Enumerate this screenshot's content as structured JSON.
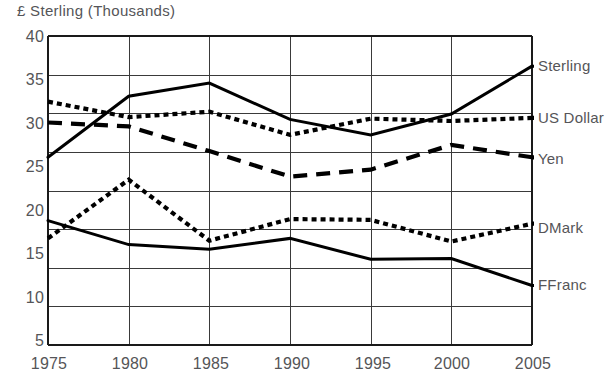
{
  "chart_data": {
    "type": "line",
    "title": "",
    "ylabel": "£ Sterling (Thousands)",
    "xlabel": "",
    "categories": [
      1975,
      1980,
      1985,
      1990,
      1995,
      2000,
      2005
    ],
    "x": [
      1975,
      1980,
      1985,
      1990,
      1995,
      2000,
      2005
    ],
    "xtick_labels": [
      "1975",
      "1980",
      "1985",
      "1990",
      "1995",
      "2000",
      "2005"
    ],
    "ytick_labels": [
      "5",
      "10",
      "15",
      "20",
      "25",
      "30",
      "35",
      "40"
    ],
    "yticks": [
      5,
      10,
      15,
      20,
      25,
      30,
      35,
      40
    ],
    "ylim": [
      0,
      40
    ],
    "xlim": [
      1975,
      2005
    ],
    "grid": true,
    "legend_position": "right-of-axes-inline",
    "series": [
      {
        "name": "Sterling",
        "style": "solid",
        "color": "#000000",
        "values": [
          24.3,
          32.2,
          33.9,
          29.2,
          27.2,
          29.9,
          36.1
        ]
      },
      {
        "name": "US Dollar",
        "style": "dotted",
        "color": "#000000",
        "values": [
          31.5,
          29.5,
          30.2,
          27.2,
          29.3,
          29.0,
          29.4
        ]
      },
      {
        "name": "Yen",
        "style": "dashed",
        "color": "#000000",
        "values": [
          28.8,
          28.3,
          25.1,
          21.8,
          22.7,
          25.9,
          24.3
        ]
      },
      {
        "name": "DMark",
        "style": "dotted",
        "color": "#000000",
        "values": [
          13.8,
          21.4,
          13.5,
          16.3,
          16.2,
          13.4,
          15.7
        ]
      },
      {
        "name": "FFranc",
        "style": "solid",
        "color": "#000000",
        "values": [
          16.1,
          13.0,
          12.4,
          13.8,
          11.1,
          11.2,
          7.7
        ]
      }
    ]
  },
  "axes": {
    "frame_color": "#1a1a1a",
    "grid_color": "#3a3a3a",
    "tick_text_color": "#555558"
  }
}
